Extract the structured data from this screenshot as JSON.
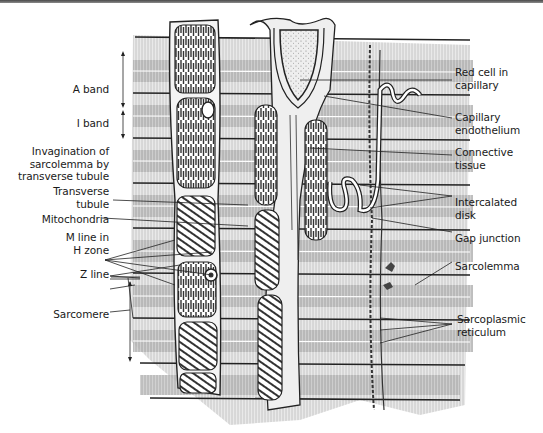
{
  "figure": {
    "left_labels": [
      {
        "id": "a-band",
        "lines": [
          "A band"
        ]
      },
      {
        "id": "i-band",
        "lines": [
          "I band"
        ]
      },
      {
        "id": "invagination",
        "lines": [
          "Invagination of",
          "sarcolemma by",
          "transverse tubule"
        ]
      },
      {
        "id": "transverse-tubule",
        "lines": [
          "Transverse",
          "tubule"
        ]
      },
      {
        "id": "mitochondria",
        "lines": [
          "Mitochondria"
        ]
      },
      {
        "id": "m-line",
        "lines": [
          "M line in",
          "H zone"
        ]
      },
      {
        "id": "z-line",
        "lines": [
          "Z line"
        ]
      },
      {
        "id": "sarcomere",
        "lines": [
          "Sarcomere"
        ]
      }
    ],
    "right_labels": [
      {
        "id": "red-cell",
        "lines": [
          "Red cell in",
          "capillary"
        ]
      },
      {
        "id": "capillary-endothelium",
        "lines": [
          "Capillary",
          "endothelium"
        ]
      },
      {
        "id": "connective-tissue",
        "lines": [
          "Connective",
          "tissue"
        ]
      },
      {
        "id": "intercalated-disk",
        "lines": [
          "Intercalated",
          "disk"
        ]
      },
      {
        "id": "gap-junction",
        "lines": [
          "Gap junction"
        ]
      },
      {
        "id": "sarcolemma",
        "lines": [
          "Sarcolemma"
        ]
      },
      {
        "id": "sarcoplasmic-reticulum",
        "lines": [
          "Sarcoplasmic",
          "reticulum"
        ]
      }
    ]
  }
}
